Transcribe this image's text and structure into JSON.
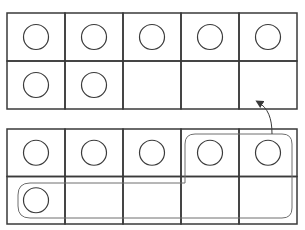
{
  "diagram": {
    "type": "ten-frames",
    "colors": {
      "grid_line": "#3a3a3a",
      "counter_stroke": "#3a3a3a",
      "loop_stroke": "#6e6e6e",
      "background": "#ffffff"
    },
    "frames": [
      {
        "name": "top-frame",
        "rows": 2,
        "cols": 5,
        "filled": [
          true,
          true,
          true,
          true,
          true,
          true,
          true,
          false,
          false,
          false
        ],
        "count": 7
      },
      {
        "name": "bottom-frame",
        "rows": 2,
        "cols": 5,
        "filled": [
          true,
          true,
          true,
          true,
          true,
          true,
          false,
          false,
          false,
          false
        ],
        "count": 6,
        "loop_group": [
          3,
          4,
          5
        ],
        "loop_count": 3
      }
    ],
    "arrow": {
      "from": "bottom-frame loop group",
      "to": "top-frame empty cells"
    }
  }
}
